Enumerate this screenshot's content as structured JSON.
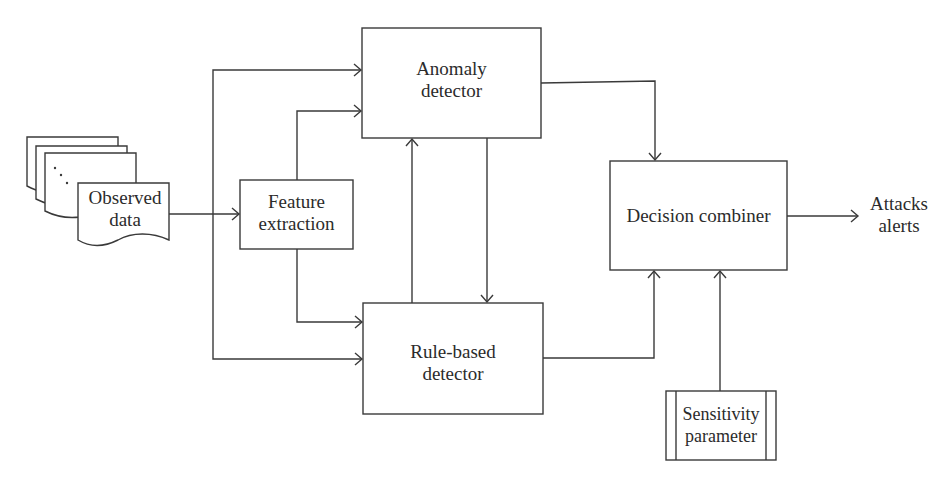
{
  "diagram": {
    "title": "",
    "nodes": {
      "observed_data": {
        "line1": "Observed",
        "line2": "data",
        "ellipsis": "..."
      },
      "feature_extraction": {
        "line1": "Feature",
        "line2": "extraction"
      },
      "anomaly_detector": {
        "line1": "Anomaly",
        "line2": "detector"
      },
      "rule_based_detector": {
        "line1": "Rule-based",
        "line2": "detector"
      },
      "decision_combiner": {
        "line1": "Decision combiner"
      },
      "sensitivity_parameter": {
        "line1": "Sensitivity",
        "line2": "parameter"
      },
      "output": {
        "line1": "Attacks",
        "line2": "alerts"
      }
    },
    "edges": [
      {
        "from": "observed_data",
        "to": "feature_extraction"
      },
      {
        "from": "observed_data",
        "to": "anomaly_detector"
      },
      {
        "from": "observed_data",
        "to": "rule_based_detector"
      },
      {
        "from": "feature_extraction",
        "to": "anomaly_detector"
      },
      {
        "from": "feature_extraction",
        "to": "rule_based_detector"
      },
      {
        "from": "rule_based_detector",
        "to": "anomaly_detector"
      },
      {
        "from": "anomaly_detector",
        "to": "rule_based_detector"
      },
      {
        "from": "anomaly_detector",
        "to": "decision_combiner"
      },
      {
        "from": "rule_based_detector",
        "to": "decision_combiner"
      },
      {
        "from": "sensitivity_parameter",
        "to": "decision_combiner"
      },
      {
        "from": "decision_combiner",
        "to": "output"
      }
    ],
    "colors": {
      "line": "#3a3a3a",
      "text": "#2b2b2b",
      "background": "#ffffff"
    }
  }
}
